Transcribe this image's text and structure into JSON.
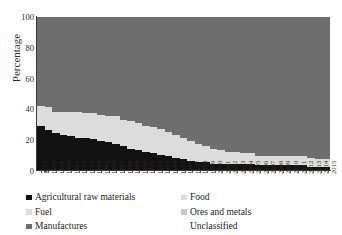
{
  "chart_data": {
    "type": "area",
    "title": "",
    "subtitle": "",
    "xlabel": "",
    "ylabel": "Percentage",
    "ylim": [
      0,
      100
    ],
    "yticks": [
      0,
      20,
      40,
      60,
      80,
      100
    ],
    "grid": false,
    "legend_position": "bottom",
    "legend_columns": 2,
    "stacked": true,
    "stack_order_bottom_to_top": [
      "Agricultural raw materials",
      "Fuel",
      "Manufactures"
    ],
    "categories": [
      "1977",
      "1978",
      "1979",
      "1980",
      "1981",
      "1982",
      "1983",
      "1984",
      "1985",
      "1986",
      "1987",
      "1988",
      "1989",
      "1990",
      "1991",
      "1992",
      "1993",
      "1994",
      "1995",
      "1996",
      "1997",
      "1998",
      "1999",
      "2000",
      "2001",
      "2002",
      "2003",
      "2004",
      "2005",
      "2006",
      "2007",
      "2008",
      "2009",
      "2010",
      "2011",
      "2012",
      "2013",
      "2014",
      "2015"
    ],
    "series": [
      {
        "name": "Agricultural raw materials",
        "color": "#111111",
        "values": [
          29,
          26,
          24,
          23,
          22,
          21,
          21,
          20,
          19,
          18,
          17,
          16,
          14,
          13,
          12,
          11,
          10,
          9,
          8,
          7,
          6,
          5,
          5,
          4,
          4,
          4,
          4,
          4,
          4,
          3,
          3,
          3,
          3,
          3,
          3,
          3,
          2,
          2,
          2
        ]
      },
      {
        "name": "Fuel",
        "color": "#dcdcdc",
        "values": [
          13,
          15,
          14,
          15,
          16,
          17,
          16,
          17,
          17,
          17,
          18,
          17,
          18,
          18,
          17,
          17,
          17,
          16,
          15,
          14,
          13,
          12,
          11,
          10,
          9,
          8,
          8,
          7,
          7,
          6,
          6,
          6,
          6,
          6,
          6,
          6,
          6,
          5,
          5
        ]
      },
      {
        "name": "Manufactures",
        "color": "#6e6e6e",
        "values": [
          58,
          59,
          62,
          62,
          62,
          62,
          63,
          63,
          64,
          65,
          65,
          67,
          68,
          69,
          71,
          72,
          73,
          75,
          77,
          79,
          81,
          83,
          84,
          86,
          87,
          88,
          88,
          89,
          89,
          91,
          91,
          91,
          91,
          91,
          91,
          91,
          92,
          93,
          93
        ]
      }
    ],
    "legend_entries": [
      {
        "label": "Agricultural raw materials",
        "color": "#111111",
        "swatch": true
      },
      {
        "label": "Fuel",
        "color": "#dcdcdc",
        "swatch": true
      },
      {
        "label": "Manufactures",
        "color": "#6e6e6e",
        "swatch": true
      },
      {
        "label": "Food",
        "color": "#dcdcdc",
        "swatch": true
      },
      {
        "label": "Ores and metals",
        "color": "#c8c8c8",
        "swatch": true
      },
      {
        "label": "Unclassified",
        "color": "#ffffff",
        "swatch": false
      }
    ]
  }
}
